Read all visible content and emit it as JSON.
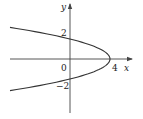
{
  "diagram": {
    "type": "function-graph",
    "equation": "x = 4 - y^2",
    "axes": {
      "x_label": "x",
      "y_label": "y"
    },
    "ticks": {
      "origin": "0",
      "x_tick": "4",
      "y_tick_pos": "2",
      "y_tick_neg": "−2"
    },
    "colors": {
      "curve": "#333333",
      "axes": "#444444",
      "text": "#222222"
    }
  }
}
